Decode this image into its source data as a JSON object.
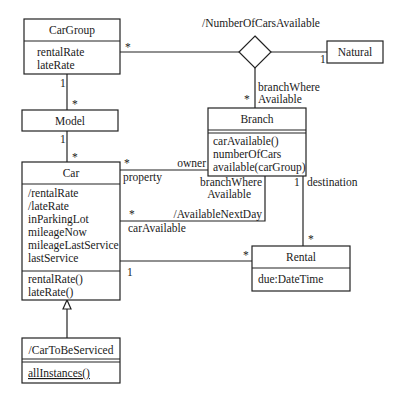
{
  "diagram": {
    "type": "UML class diagram",
    "classes": {
      "cargroup": {
        "name": "CarGroup",
        "attributes": [
          "rentalRate",
          "lateRate"
        ]
      },
      "model": {
        "name": "Model"
      },
      "car": {
        "name": "Car",
        "attributes": [
          "/rentalRate",
          "/lateRate",
          "inParkingLot",
          "mileageNow",
          "mileageLastService",
          "lastService"
        ],
        "operations": [
          "rentalRate()",
          "lateRate()"
        ]
      },
      "branch": {
        "name": "Branch",
        "operations": [
          "carAvailable()",
          "numberOfCars",
          "available(carGroup)"
        ]
      },
      "rental": {
        "name": "Rental",
        "attributes": [
          "due:DateTime"
        ]
      },
      "natural": {
        "name": "Natural"
      },
      "cartobeserviced": {
        "name": "/CarToBeServiced",
        "operations": [
          "allInstances()"
        ]
      }
    },
    "associations": {
      "ternary": {
        "name": "/NumberOfCarsAvailable",
        "cargroup_mult": "*",
        "natural_mult": "1",
        "branch_role": [
          "branchWhere",
          "Available"
        ],
        "branch_mult": "*"
      },
      "cargroup_model": {
        "cargroup_mult": "1",
        "model_mult": "*"
      },
      "model_car": {
        "model_mult": "1",
        "car_mult": "*"
      },
      "car_branch_owner": {
        "car_mult": "*",
        "car_role": "property",
        "branch_role": "owner"
      },
      "available_next_day": {
        "name": "/AvailableNextDay",
        "car_mult": "*",
        "car_role": "carAvailable",
        "branch_role": [
          "branchWhere",
          "Available"
        ]
      },
      "branch_rental": {
        "branch_mult": "1",
        "branch_role": "destination",
        "rental_mult": "*"
      },
      "car_rental": {
        "car_mult": "1",
        "rental_mult": "*"
      },
      "generalization": {
        "child": "/CarToBeServiced",
        "parent": "Car"
      }
    }
  }
}
